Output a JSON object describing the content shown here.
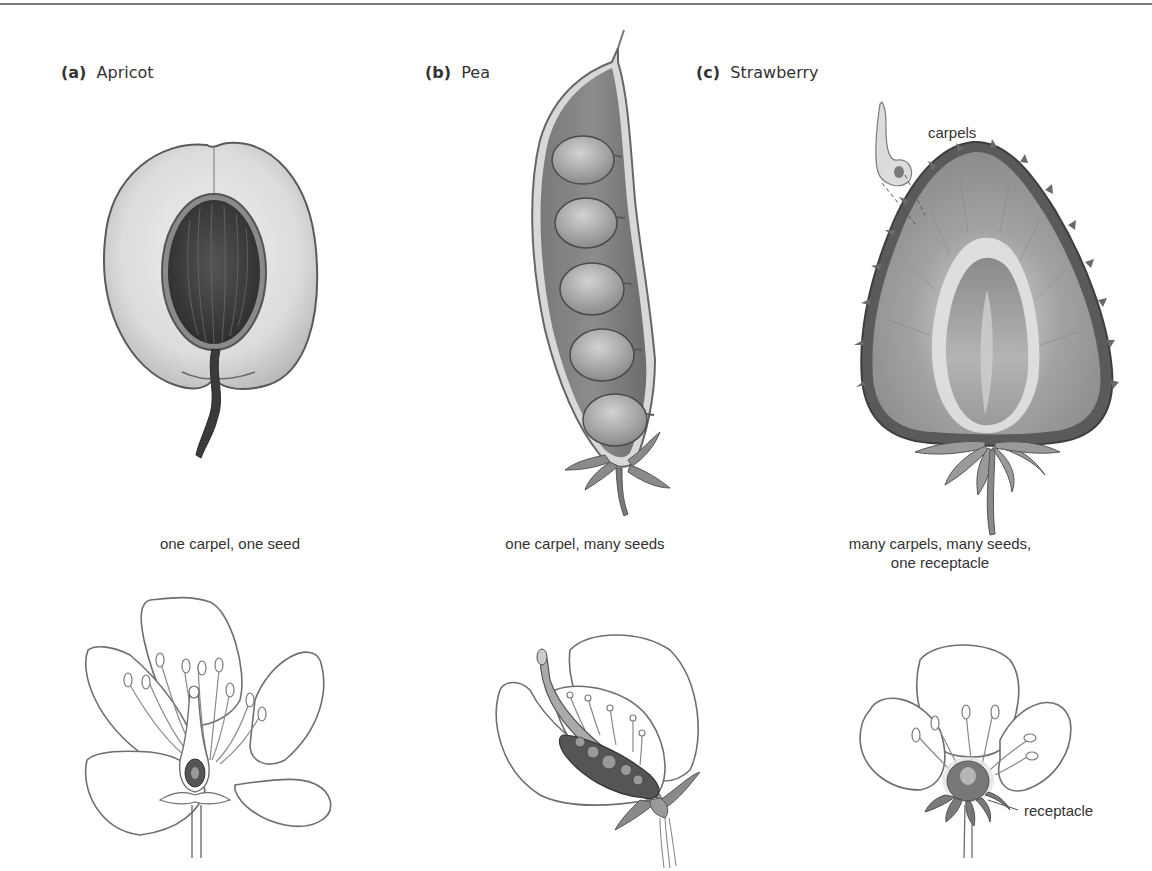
{
  "figure": {
    "panels": [
      {
        "letter": "(a)",
        "name": "Apricot",
        "caption_line1": "one carpel, one seed",
        "caption_line2": ""
      },
      {
        "letter": "(b)",
        "name": "Pea",
        "caption_line1": "one carpel, many seeds",
        "caption_line2": ""
      },
      {
        "letter": "(c)",
        "name": "Strawberry",
        "caption_line1": "many carpels, many seeds,",
        "caption_line2": "one receptacle"
      }
    ],
    "annotations": {
      "carpels": "carpels",
      "receptacle": "receptacle"
    },
    "colors": {
      "text": "#333333",
      "line": "#6e6e6e",
      "fruit_light": "#e6e6e6",
      "fruit_mid": "#9a9a9a",
      "fruit_dark": "#4a4a4a"
    }
  }
}
